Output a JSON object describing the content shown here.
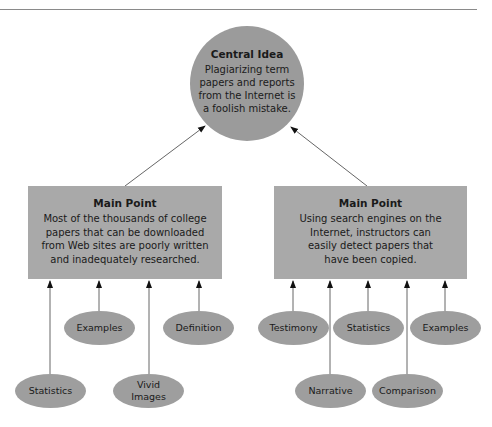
{
  "central": {
    "title": "Central Idea",
    "text": "Plagiarizing term papers and reports from the Internet is a foolish mistake."
  },
  "main_points": [
    {
      "title": "Main Point",
      "text": "Most of the thousands of college papers that can be downloaded from Web sites are poorly written and inadequately researched.",
      "supports": [
        "Statistics",
        "Examples",
        "Vivid Images",
        "Definition"
      ]
    },
    {
      "title": "Main Point",
      "text": "Using search engines on the Internet, instructors can easily detect papers that have been copied.",
      "supports": [
        "Testimony",
        "Narrative",
        "Statistics",
        "Comparison",
        "Examples"
      ]
    }
  ],
  "colors": {
    "central_fill": "#9b9b9b",
    "box_fill": "#a9a9a9",
    "ellipse_fill": "#9e9e9e",
    "arrow": "#555555"
  }
}
